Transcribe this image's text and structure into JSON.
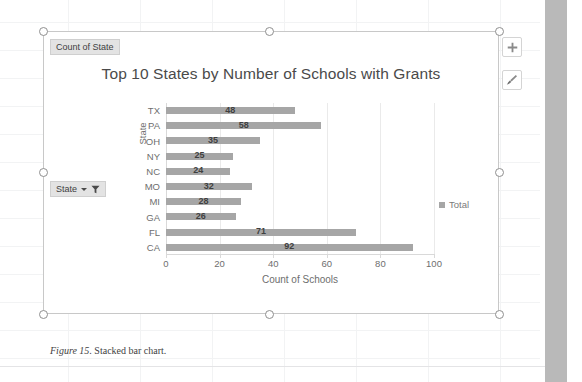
{
  "document": {
    "caption_number": "Figure 15",
    "caption_text": ". Stacked bar chart."
  },
  "chart_object": {
    "field_buttons": [
      {
        "label": "Count of State",
        "has_dropdown": false,
        "has_filter": false,
        "name": "field-count-of-state"
      },
      {
        "label": "State",
        "has_dropdown": true,
        "has_filter": true,
        "name": "field-state"
      }
    ],
    "tools": [
      {
        "label": "Chart Elements",
        "icon": "plus-icon"
      },
      {
        "label": "Chart Styles",
        "icon": "paintbrush-icon"
      }
    ],
    "selection_handles": 8
  },
  "chart_data": {
    "type": "bar",
    "orientation": "horizontal",
    "title": "Top 10 States by Number of Schools with Grants",
    "xlabel": "Count of Schools",
    "ylabel": "State",
    "categories": [
      "TX",
      "PA",
      "OH",
      "NY",
      "NC",
      "MO",
      "MI",
      "GA",
      "FL",
      "CA"
    ],
    "values": [
      48,
      58,
      35,
      25,
      24,
      32,
      28,
      26,
      71,
      92
    ],
    "series": [
      {
        "name": "Total",
        "values": [
          48,
          58,
          35,
          25,
          24,
          32,
          28,
          26,
          71,
          92
        ],
        "color": "#a6a6a6"
      }
    ],
    "data_labels": [
      "48",
      "58",
      "35",
      "25",
      "24",
      "32",
      "28",
      "26",
      "71",
      "92"
    ],
    "xlim": [
      0,
      100
    ],
    "xticks": [
      0,
      20,
      40,
      60,
      80,
      100
    ],
    "xtick_labels": [
      "0",
      "20",
      "40",
      "60",
      "80",
      "100"
    ],
    "grid": "vertical",
    "legend": {
      "position": "right",
      "entries": [
        "Total"
      ]
    },
    "bar_color": "#a6a6a6"
  },
  "colors": {
    "bar": "#a6a6a6",
    "gridline": "#eaeaea",
    "axis_text": "#6e6e6e",
    "title_text": "#4a4a4a",
    "field_button_bg": "#e3e3e3",
    "scrollbar": "#b9b9b9"
  }
}
